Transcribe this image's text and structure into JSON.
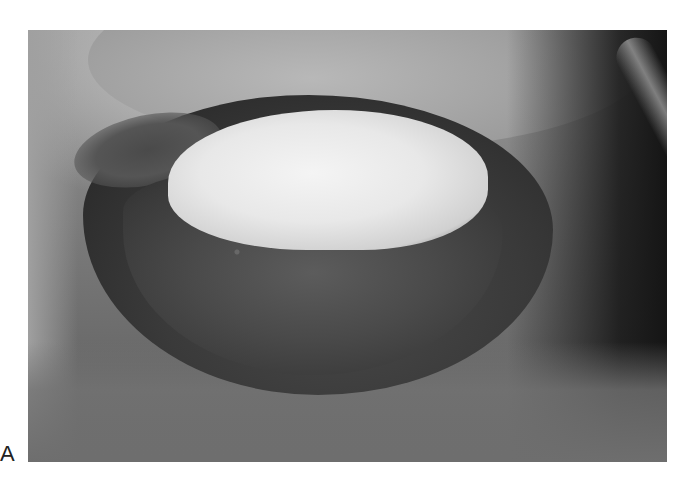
{
  "figure": {
    "panel_label": "A",
    "image_description": "Grayscale clinical photograph of a large wound with a bright central area surrounded by dark necrotic tissue",
    "colors": {
      "background": "#ffffff",
      "bright_area": "#eeeeee",
      "lesion_dark": "#3a3a3a",
      "skin_mid": "#8a8a8a",
      "shadow": "#151515"
    }
  }
}
